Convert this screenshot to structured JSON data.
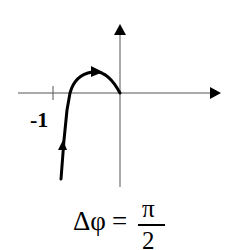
{
  "diagram": {
    "axes": {
      "origin": [
        120,
        93
      ],
      "x_axis": {
        "from": 18,
        "to": 221,
        "arrow": true
      },
      "y_axis": {
        "from": 187,
        "to": 24,
        "arrow": true
      },
      "tick": {
        "x": 53,
        "label": "-1"
      }
    },
    "curve": {
      "description": "curve rising from below, crossing the real axis right of -1, arching over and ending at origin",
      "arrows": [
        "upward near bottom",
        "rightward near top of arch"
      ],
      "color": "#000000"
    },
    "formula": {
      "lhs": "Δφ",
      "equals": "=",
      "numerator": "π",
      "denominator": "2"
    }
  }
}
